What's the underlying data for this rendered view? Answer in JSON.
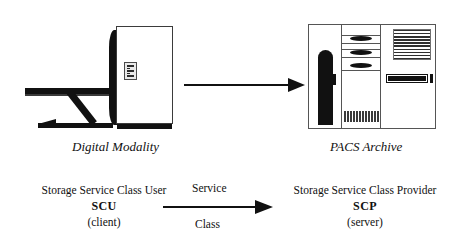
{
  "diagram": {
    "background_color": "#ffffff",
    "ink_color": "#111111"
  },
  "modality": {
    "caption": "Digital Modality",
    "icon_name": "digital-modality-illustration",
    "parts": {
      "table": "imaging-table",
      "cabinet": "modality-cabinet",
      "control_panel": "modality-control-panel"
    }
  },
  "archive": {
    "caption": "PACS Archive",
    "icon_name": "pacs-archive-illustration",
    "parts": {
      "left_bay": "tape-library-bay",
      "middle_bay": "drive-bay",
      "right_bay": "server-bay",
      "louvers": "ventilation-louvers",
      "barcode": "barcode-strip"
    }
  },
  "transfer_arrow": {
    "icon_name": "right-arrow-icon",
    "direction": "right",
    "from": "Digital Modality",
    "to": "PACS Archive"
  },
  "service_relation": {
    "arrow": {
      "icon_name": "right-arrow-icon",
      "direction": "right"
    },
    "label_top": "Service",
    "label_bottom": "Class",
    "client": {
      "title": "Storage Service Class User",
      "abbreviation": "SCU",
      "role": "(client)"
    },
    "server": {
      "title": "Storage Service Class Provider",
      "abbreviation": "SCP",
      "role": "(server)"
    }
  }
}
